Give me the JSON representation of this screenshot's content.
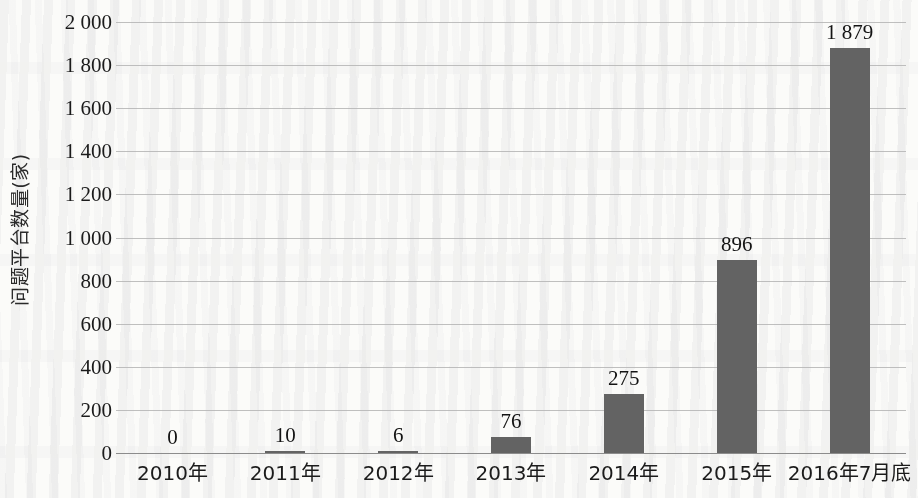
{
  "chart_data": {
    "type": "bar",
    "title": "",
    "subtitle": "",
    "xlabel": "",
    "ylabel": "问题平台数量(家)",
    "categories": [
      "2010年",
      "2011年",
      "2012年",
      "2013年",
      "2014年",
      "2015年",
      "2016年7月底"
    ],
    "values": [
      0,
      10,
      6,
      76,
      275,
      896,
      1879
    ],
    "value_labels": [
      "0",
      "10",
      "6",
      "76",
      "275",
      "896",
      "1 879"
    ],
    "ylim": [
      0,
      2000
    ],
    "ytick_values": [
      0,
      200,
      400,
      600,
      800,
      1000,
      1200,
      1400,
      1600,
      1800,
      2000
    ],
    "ytick_labels": [
      "0",
      "200",
      "400",
      "600",
      "800",
      "1 000",
      "1 200",
      "1 400",
      "1 600",
      "1 800",
      "2 000"
    ],
    "grid": true,
    "grid_axis": "y",
    "legend": false,
    "legend_position": "none",
    "series": [
      {
        "name": "问题平台数量",
        "values": [
          0,
          10,
          6,
          76,
          275,
          896,
          1879
        ],
        "color": "#636363"
      }
    ],
    "bar_color": "#636363",
    "gridline_color": "#b4b4b4",
    "axis_color": "#8c8c8c",
    "background_color": "#fbfbf9",
    "text_color": "#1b1b1b"
  }
}
